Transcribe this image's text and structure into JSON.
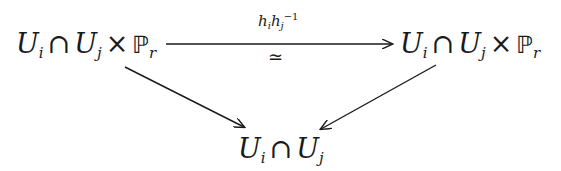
{
  "diagram": {
    "type": "commutative-diagram",
    "nodes": {
      "top_left": {
        "U1": "U",
        "sub1": "i",
        "cap": "∩",
        "U2": "U",
        "sub2": "j",
        "times": "×",
        "P": "ℙ",
        "subP": "r"
      },
      "top_right": {
        "U1": "U",
        "sub1": "i",
        "cap": "∩",
        "U2": "U",
        "sub2": "j",
        "times": "×",
        "P": "ℙ",
        "subP": "r"
      },
      "bottom": {
        "U1": "U",
        "sub1": "i",
        "cap": "∩",
        "U2": "U",
        "sub2": "j"
      }
    },
    "edges": [
      {
        "from": "top_left",
        "to": "top_right",
        "label_above": {
          "h1": "h",
          "s1": "i",
          "h2": "h",
          "s2": "j",
          "exp": "−1"
        },
        "label_below": "≃"
      },
      {
        "from": "top_left",
        "to": "bottom"
      },
      {
        "from": "top_right",
        "to": "bottom"
      }
    ],
    "colors": {
      "ink": "#1a1a1a",
      "background": "#ffffff"
    }
  }
}
